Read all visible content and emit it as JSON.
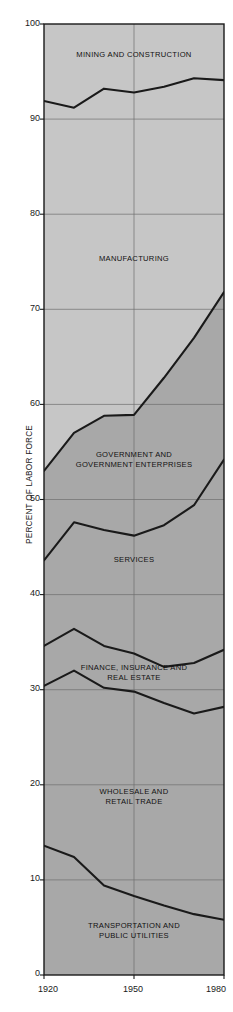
{
  "chart_data": {
    "type": "area",
    "title": "",
    "subtitle": "",
    "xlabel": "",
    "ylabel": "PERCENT OF LABOR FORCE",
    "xlim": [
      1920,
      1980
    ],
    "ylim": [
      0,
      100
    ],
    "grid": true,
    "legend_position": "inline-labels",
    "x": [
      1920,
      1930,
      1940,
      1950,
      1960,
      1970,
      1980
    ],
    "xticks": [
      "1920",
      "1950",
      "1980"
    ],
    "xtick_values": [
      1920,
      1950,
      1980
    ],
    "yticks": [
      "0",
      "10",
      "20",
      "30",
      "40",
      "50",
      "60",
      "70",
      "80",
      "90",
      "100"
    ],
    "ytick_values": [
      0,
      10,
      20,
      30,
      40,
      50,
      60,
      70,
      80,
      90,
      100
    ],
    "note": "Cumulative stacked boundary lines, percent of labor force, reading bottom-up",
    "boundaries": [
      {
        "name": "transportation-and-public-utilities-top",
        "values": [
          13.6,
          12.4,
          9.4,
          8.3,
          7.3,
          6.4,
          5.8
        ]
      },
      {
        "name": "wholesale-and-retail-trade-top",
        "values": [
          30.4,
          32.0,
          30.2,
          29.8,
          28.6,
          27.5,
          28.2
        ]
      },
      {
        "name": "finance-insurance-and-real-estate-top",
        "values": [
          34.6,
          36.4,
          34.6,
          33.8,
          32.4,
          32.8,
          34.2
        ]
      },
      {
        "name": "services-top",
        "values": [
          43.6,
          47.6,
          46.8,
          46.2,
          47.3,
          49.4,
          54.2
        ]
      },
      {
        "name": "government-and-government-enterprises-top",
        "values": [
          53.0,
          57.0,
          58.8,
          58.9,
          62.8,
          67.0,
          71.8
        ]
      },
      {
        "name": "manufacturing-top",
        "values": [
          91.9,
          91.2,
          93.2,
          92.8,
          93.4,
          94.3,
          94.1
        ]
      }
    ],
    "series": [
      {
        "name": "TRANSPORTATION AND PUBLIC UTILITIES",
        "values": [
          13.6,
          12.4,
          9.4,
          8.3,
          7.3,
          6.4,
          5.8
        ]
      },
      {
        "name": "WHOLESALE AND RETAIL TRADE",
        "values": [
          16.8,
          19.6,
          20.8,
          21.5,
          21.3,
          21.1,
          22.4
        ]
      },
      {
        "name": "FINANCE, INSURANCE AND REAL ESTATE",
        "values": [
          4.2,
          4.4,
          4.4,
          4.0,
          3.8,
          5.3,
          6.0
        ]
      },
      {
        "name": "SERVICES",
        "values": [
          9.0,
          11.2,
          12.2,
          12.4,
          14.9,
          16.6,
          20.0
        ]
      },
      {
        "name": "GOVERNMENT AND GOVERNMENT ENTERPRISES",
        "values": [
          9.4,
          9.4,
          12.0,
          12.7,
          15.5,
          17.6,
          17.6
        ]
      },
      {
        "name": "MANUFACTURING",
        "values": [
          38.9,
          34.2,
          34.4,
          33.9,
          30.6,
          27.3,
          22.3
        ]
      },
      {
        "name": "MINING AND CONSTRUCTION",
        "values": [
          8.1,
          8.8,
          6.8,
          7.2,
          6.6,
          5.7,
          5.9
        ]
      }
    ],
    "region_labels": [
      {
        "key": "mining_construction",
        "text": "MINING AND CONSTRUCTION",
        "lines": [
          "MINING AND CONSTRUCTION"
        ]
      },
      {
        "key": "manufacturing",
        "text": "MANUFACTURING",
        "lines": [
          "MANUFACTURING"
        ]
      },
      {
        "key": "government",
        "text": "GOVERNMENT AND GOVERNMENT ENTERPRISES",
        "lines": [
          "GOVERNMENT AND",
          "GOVERNMENT ENTERPRISES"
        ]
      },
      {
        "key": "services",
        "text": "SERVICES",
        "lines": [
          "SERVICES"
        ]
      },
      {
        "key": "finance",
        "text": "FINANCE, INSURANCE AND REAL ESTATE",
        "lines": [
          "FINANCE, INSURANCE AND",
          "REAL ESTATE"
        ]
      },
      {
        "key": "wholesale",
        "text": "WHOLESALE AND RETAIL TRADE",
        "lines": [
          "WHOLESALE AND",
          "RETAIL TRADE"
        ]
      },
      {
        "key": "transportation",
        "text": "TRANSPORTATION AND PUBLIC UTILITIES",
        "lines": [
          "TRANSPORTATION AND",
          "PUBLIC UTILITIES"
        ]
      }
    ],
    "colors": {
      "upper_fill": "#c6c6c6",
      "lower_fill": "#a8a8a8",
      "line": "#1a1a1a",
      "grid": "#6e6e6e",
      "axis": "#1a1a1a",
      "text": "#1a1a1a",
      "background": "#ffffff"
    }
  },
  "axis": {
    "y_title": "PERCENT OF LABOR FORCE",
    "yticks": [
      "100",
      "90",
      "80",
      "70",
      "60",
      "50",
      "40",
      "30",
      "20",
      "10",
      "0"
    ],
    "xticks": [
      "1920",
      "1950",
      "1980"
    ]
  },
  "labels": {
    "mining_construction_l1": "MINING AND CONSTRUCTION",
    "manufacturing_l1": "MANUFACTURING",
    "government_l1": "GOVERNMENT AND",
    "government_l2": "GOVERNMENT ENTERPRISES",
    "services_l1": "SERVICES",
    "finance_l1": "FINANCE, INSURANCE AND",
    "finance_l2": "REAL ESTATE",
    "wholesale_l1": "WHOLESALE AND",
    "wholesale_l2": "RETAIL TRADE",
    "transportation_l1": "TRANSPORTATION AND",
    "transportation_l2": "PUBLIC UTILITIES"
  }
}
